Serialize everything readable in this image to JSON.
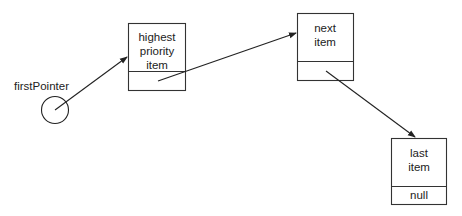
{
  "diagram": {
    "pointer": {
      "label": "firstPointer"
    },
    "nodes": [
      {
        "id": "highest",
        "lines": [
          "highest",
          "priority",
          "item"
        ],
        "pointer_field": ""
      },
      {
        "id": "next",
        "lines": [
          "next",
          "item"
        ],
        "pointer_field": ""
      },
      {
        "id": "last",
        "lines": [
          "last",
          "item"
        ],
        "pointer_field": "null"
      }
    ],
    "edges": [
      {
        "from": "firstPointer",
        "to": "highest"
      },
      {
        "from": "highest",
        "to": "next"
      },
      {
        "from": "next",
        "to": "last"
      }
    ],
    "colors": {
      "stroke": "#222222",
      "background": "#ffffff"
    }
  }
}
